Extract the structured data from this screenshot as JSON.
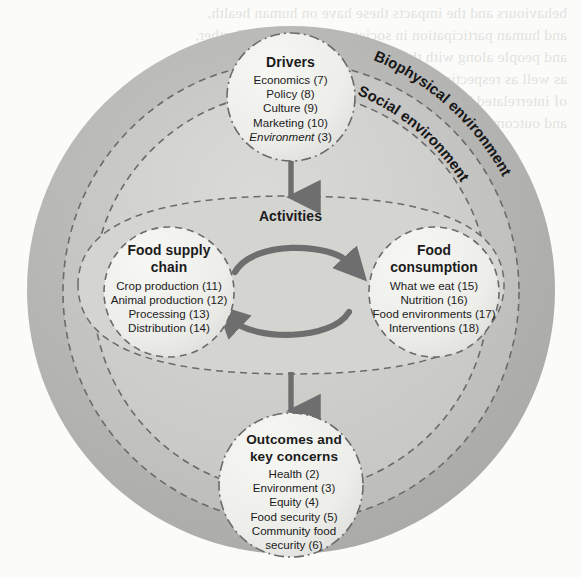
{
  "diagram": {
    "background_color": "#fbfbf9",
    "outer_ring_color": "#b2b2b2",
    "mid_ring_color": "#bdbdbd",
    "inner_ring_color": "#cacaca",
    "node_fill_color": "#efefec",
    "arrow_color": "#6e6e6e",
    "dash_color": "#6b6b6b"
  },
  "rings": [
    {
      "name": "biophysical",
      "label": "Biophysical environment"
    },
    {
      "name": "social",
      "label": "Social environment"
    }
  ],
  "activities": {
    "label": "Activities"
  },
  "nodes": {
    "drivers": {
      "title": "Drivers",
      "items": [
        {
          "label": "Economics",
          "num": "(7)",
          "italic": false
        },
        {
          "label": "Policy",
          "num": "(8)",
          "italic": false
        },
        {
          "label": "Culture",
          "num": "(9)",
          "italic": false
        },
        {
          "label": "Marketing",
          "num": "(10)",
          "italic": false
        },
        {
          "label": "Environment",
          "num": "(3)",
          "italic": true
        }
      ]
    },
    "food_supply_chain": {
      "title_line1": "Food supply",
      "title_line2": "chain",
      "items": [
        {
          "label": "Crop production",
          "num": "(11)",
          "italic": false
        },
        {
          "label": "Animal production",
          "num": "(12)",
          "italic": false
        },
        {
          "label": "Processing",
          "num": "(13)",
          "italic": false
        },
        {
          "label": "Distribution",
          "num": "(14)",
          "italic": false
        }
      ]
    },
    "food_consumption": {
      "title_line1": "Food",
      "title_line2": "consumption",
      "items": [
        {
          "label": "What we eat",
          "num": "(15)",
          "italic": false
        },
        {
          "label": "Nutrition",
          "num": "(16)",
          "italic": false
        },
        {
          "label": "Food environments",
          "num": "(17)",
          "italic": false
        },
        {
          "label": "Interventions",
          "num": "(18)",
          "italic": false
        }
      ]
    },
    "outcomes": {
      "title_line1": "Outcomes and",
      "title_line2": "key concerns",
      "items": [
        {
          "label": "Health",
          "num": "(2)",
          "italic": false
        },
        {
          "label": "Environment",
          "num": "(3)",
          "italic": false
        },
        {
          "label": "Equity",
          "num": "(4)",
          "italic": false
        },
        {
          "label": "Food security",
          "num": "(5)",
          "italic": false
        },
        {
          "label": "Community food",
          "num": "",
          "italic": false
        },
        {
          "label": "security",
          "num": "(6)",
          "italic": false
        }
      ]
    }
  },
  "ghost_text": {
    "lines": [
      "behaviours and the impacts these have on human health,",
      "and human participation in society and outcomes. Further,",
      "and people along with the distribution of resources",
      "as well as respecting the modern market",
      "of interrelated behaviour, their",
      "and outcomes are under limited"
    ]
  }
}
